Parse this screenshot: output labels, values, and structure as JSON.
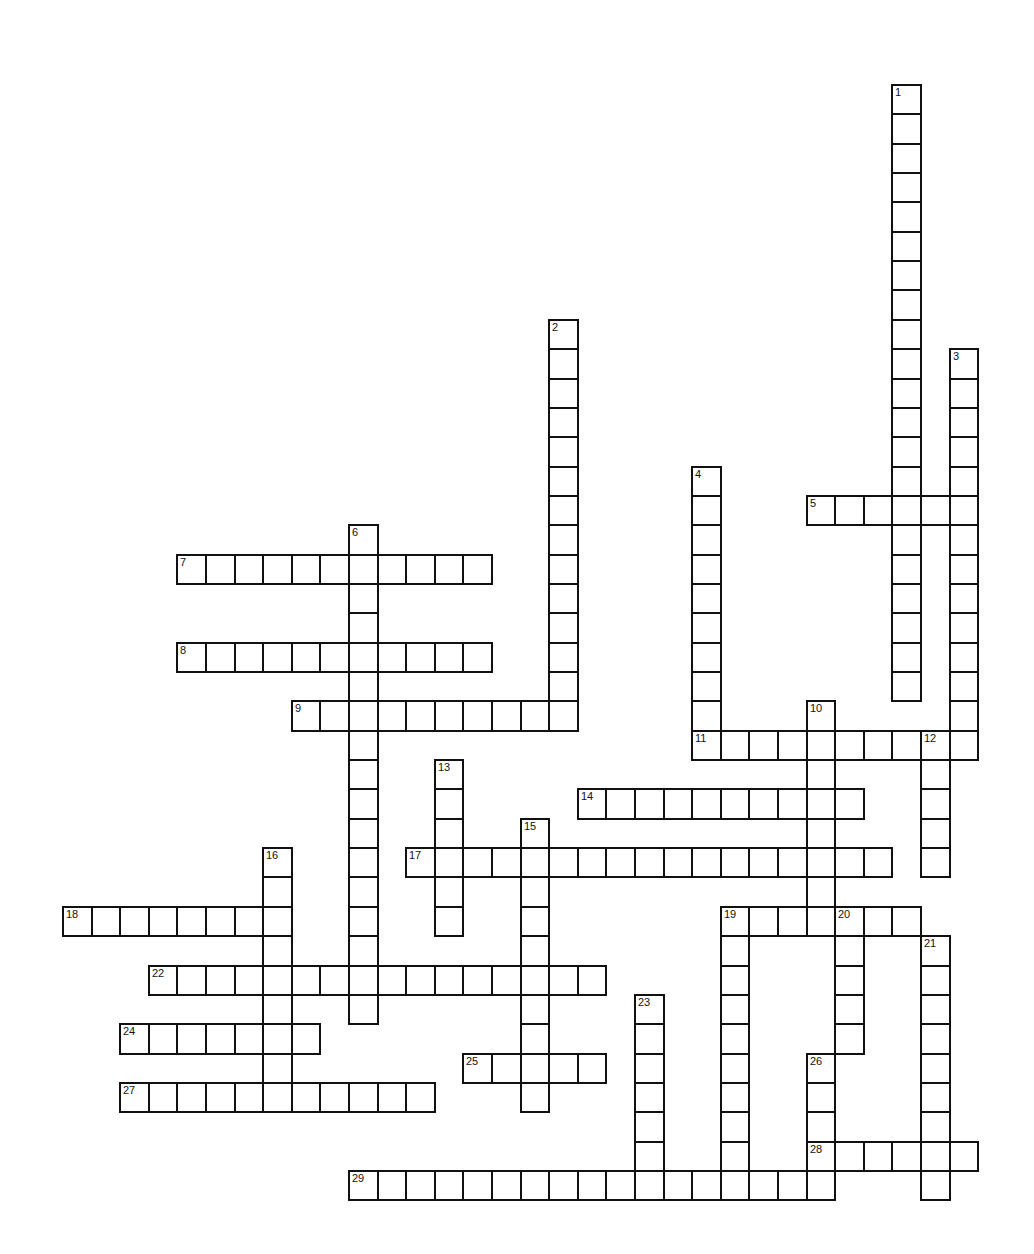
{
  "puzzle": {
    "type": "crossword",
    "colors": {
      "grid_line": "#111111",
      "cell_fill": "#ffffff",
      "background": "#ffffff"
    },
    "grid": {
      "origin_x": 62,
      "origin_y": 84,
      "pitch_x": 28.6,
      "pitch_y": 29.35
    },
    "words": [
      {
        "number": "1",
        "direction": "down",
        "col": 29,
        "row": 0,
        "length": 21
      },
      {
        "number": "2",
        "direction": "down",
        "col": 17,
        "row": 8,
        "length": 14
      },
      {
        "number": "3",
        "direction": "down",
        "col": 31,
        "row": 9,
        "length": 14
      },
      {
        "number": "4",
        "direction": "down",
        "col": 22,
        "row": 13,
        "length": 10
      },
      {
        "number": "5",
        "direction": "across",
        "col": 26,
        "row": 14,
        "length": 6
      },
      {
        "number": "6",
        "direction": "down",
        "col": 10,
        "row": 15,
        "length": 17
      },
      {
        "number": "7",
        "direction": "across",
        "col": 4,
        "row": 16,
        "length": 11
      },
      {
        "number": "8",
        "direction": "across",
        "col": 4,
        "row": 19,
        "length": 11
      },
      {
        "number": "9",
        "direction": "across",
        "col": 8,
        "row": 21,
        "length": 10
      },
      {
        "number": "10",
        "direction": "down",
        "col": 26,
        "row": 21,
        "length": 8
      },
      {
        "number": "11",
        "direction": "across",
        "col": 22,
        "row": 22,
        "length": 10
      },
      {
        "number": "12",
        "direction": "down",
        "col": 30,
        "row": 22,
        "length": 5
      },
      {
        "number": "13",
        "direction": "down",
        "col": 13,
        "row": 23,
        "length": 6
      },
      {
        "number": "14",
        "direction": "across",
        "col": 18,
        "row": 24,
        "length": 10
      },
      {
        "number": "15",
        "direction": "down",
        "col": 16,
        "row": 25,
        "length": 10
      },
      {
        "number": "16",
        "direction": "down",
        "col": 7,
        "row": 26,
        "length": 9
      },
      {
        "number": "17",
        "direction": "across",
        "col": 12,
        "row": 26,
        "length": 17
      },
      {
        "number": "18",
        "direction": "across",
        "col": 0,
        "row": 28,
        "length": 8
      },
      {
        "number": "19",
        "direction": "across",
        "col": 23,
        "row": 28,
        "length": 7
      },
      {
        "number": "19d",
        "direction": "down",
        "col": 23,
        "row": 28,
        "length": 10,
        "label": ""
      },
      {
        "number": "20",
        "direction": "down",
        "col": 27,
        "row": 28,
        "length": 5
      },
      {
        "number": "21",
        "direction": "down",
        "col": 30,
        "row": 29,
        "length": 9
      },
      {
        "number": "22",
        "direction": "across",
        "col": 3,
        "row": 30,
        "length": 16
      },
      {
        "number": "23",
        "direction": "down",
        "col": 20,
        "row": 31,
        "length": 7
      },
      {
        "number": "24",
        "direction": "across",
        "col": 2,
        "row": 32,
        "length": 7
      },
      {
        "number": "25",
        "direction": "across",
        "col": 14,
        "row": 33,
        "length": 5
      },
      {
        "number": "26",
        "direction": "down",
        "col": 26,
        "row": 33,
        "length": 5
      },
      {
        "number": "27",
        "direction": "across",
        "col": 2,
        "row": 34,
        "length": 11
      },
      {
        "number": "28",
        "direction": "across",
        "col": 26,
        "row": 36,
        "length": 6
      },
      {
        "number": "29",
        "direction": "across",
        "col": 10,
        "row": 37,
        "length": 17
      }
    ]
  }
}
